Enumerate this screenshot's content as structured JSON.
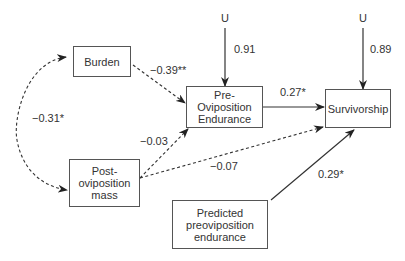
{
  "nodes": {
    "burden": {
      "label": "Burden"
    },
    "pre_endurance": {
      "label": "Pre-\nOviposition\nEndurance",
      "lines": [
        "Pre-",
        "Oviposition",
        "Endurance"
      ]
    },
    "survivorship": {
      "label": "Survivorship"
    },
    "post_mass": {
      "label": "Post-\noviposition\nmass",
      "lines": [
        "Post-",
        "oviposition",
        "mass"
      ]
    },
    "predicted": {
      "label": "Predicted\npreoviposition\nendurance",
      "lines": [
        "Predicted",
        "preoviposition",
        "endurance"
      ]
    },
    "u1": {
      "label": "U"
    },
    "u2": {
      "label": "U"
    }
  },
  "edges": {
    "burden_to_pre": {
      "coef": "−0.39**",
      "style": "dashed"
    },
    "post_to_pre": {
      "coef": "−0.03",
      "style": "dashed"
    },
    "post_to_surv": {
      "coef": "−0.07",
      "style": "dashed"
    },
    "burden_post_corr": {
      "coef": "−0.31*",
      "style": "dashed-curved-bidirectional"
    },
    "pre_to_surv": {
      "coef": "0.27*",
      "style": "solid"
    },
    "predicted_to_surv": {
      "coef": "0.29*",
      "style": "solid"
    },
    "u1_to_pre": {
      "coef": "0.91",
      "style": "solid"
    },
    "u2_to_surv": {
      "coef": "0.89",
      "style": "solid"
    }
  },
  "colors": {
    "line": "#333333",
    "text": "#333333",
    "box_border": "#555555"
  }
}
